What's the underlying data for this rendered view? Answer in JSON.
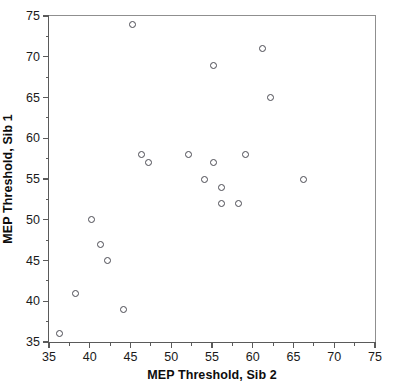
{
  "chart_data": {
    "type": "scatter",
    "title": "",
    "xlabel": "MEP Threshold, Sib 2",
    "ylabel": "MEP Threshold, Sib 1",
    "xlim": [
      35,
      75
    ],
    "ylim": [
      35,
      75
    ],
    "grid": false,
    "legend": null,
    "marker": "open-circle",
    "x_major_ticks": [
      35,
      40,
      45,
      50,
      55,
      60,
      65,
      70,
      75
    ],
    "y_major_ticks": [
      35,
      40,
      45,
      50,
      55,
      60,
      65,
      70,
      75
    ],
    "x_tick_labels": [
      "35",
      "40",
      "45",
      "50",
      "55",
      "60",
      "65",
      "70",
      "75"
    ],
    "y_tick_labels": [
      "35",
      "40",
      "45",
      "50",
      "55",
      "60",
      "65",
      "70",
      "75"
    ],
    "x_minor_ticks": [
      37.5,
      42.5,
      47.5,
      52.5,
      57.5,
      62.5,
      67.5,
      72.5
    ],
    "y_minor_ticks": [
      37.5,
      42.5,
      47.5,
      52.5,
      57.5,
      62.5,
      67.5,
      72.5
    ],
    "points": [
      {
        "x": 36.3,
        "y": 36.0
      },
      {
        "x": 38.3,
        "y": 41.0
      },
      {
        "x": 40.2,
        "y": 50.0
      },
      {
        "x": 41.3,
        "y": 47.0
      },
      {
        "x": 42.2,
        "y": 45.0
      },
      {
        "x": 44.2,
        "y": 39.0
      },
      {
        "x": 45.2,
        "y": 73.9
      },
      {
        "x": 46.3,
        "y": 58.0
      },
      {
        "x": 47.2,
        "y": 57.0
      },
      {
        "x": 52.1,
        "y": 58.0
      },
      {
        "x": 54.1,
        "y": 55.0
      },
      {
        "x": 55.2,
        "y": 68.9
      },
      {
        "x": 55.2,
        "y": 57.0
      },
      {
        "x": 56.2,
        "y": 54.0
      },
      {
        "x": 56.2,
        "y": 52.0
      },
      {
        "x": 58.2,
        "y": 52.0
      },
      {
        "x": 59.1,
        "y": 58.0
      },
      {
        "x": 61.2,
        "y": 71.0
      },
      {
        "x": 62.2,
        "y": 65.0
      },
      {
        "x": 66.2,
        "y": 55.0
      }
    ]
  },
  "colors": {
    "marker_stroke": "#4a4a52",
    "axis": "#5a5a5a",
    "text": "#1a1a1a",
    "background": "#ffffff"
  }
}
